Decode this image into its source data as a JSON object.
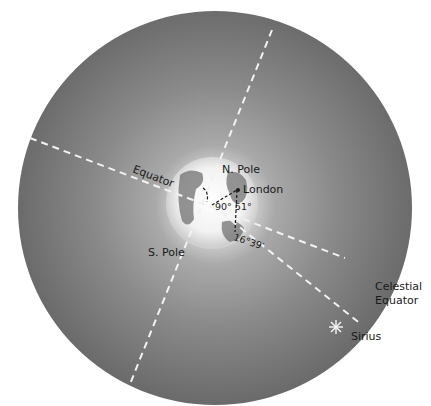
{
  "diagram": {
    "labels": {
      "north_pole": "N. Pole",
      "south_pole": "S. Pole",
      "equator": "Equator",
      "london": "London",
      "angle_latitude": "90° 51°",
      "angle_declination": "16°39′",
      "celestial_equator_line1": "Celestial",
      "celestial_equator_line2": "Equator",
      "sirius": "Sirius"
    },
    "colors": {
      "sphere_dark": "#6e6e6e",
      "sphere_mid": "#8a8a8a",
      "glow": "#f4f4f4",
      "dashes": "#f0f0f0",
      "text": "#1a1a1a"
    }
  }
}
